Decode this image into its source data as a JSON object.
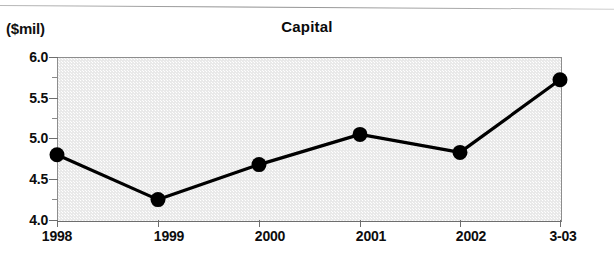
{
  "figure": {
    "unit_label": "($mil)",
    "title": "Capital"
  },
  "chart_data": {
    "type": "line",
    "title": "Capital",
    "subtitle": "",
    "xlabel": "",
    "ylabel": "($mil)",
    "unit": "$mil",
    "categories": [
      "1998",
      "1999",
      "2000",
      "2001",
      "2002",
      "3-03"
    ],
    "values": [
      4.8,
      4.25,
      4.68,
      5.05,
      4.83,
      5.72
    ],
    "series": [
      {
        "name": "Capital",
        "values": [
          4.8,
          4.25,
          4.68,
          5.05,
          4.83,
          5.72
        ]
      }
    ],
    "ylim": [
      4.0,
      6.0
    ],
    "y_major_ticks": [
      "4.0",
      "4.5",
      "5.0",
      "5.5",
      "6.0"
    ],
    "y_major_tick_values": [
      4.0,
      4.5,
      5.0,
      5.5,
      6.0
    ],
    "y_minor_tick_values": [
      4.25,
      4.75,
      5.25,
      5.75
    ],
    "y_tick_interval": 0.5,
    "y_minor_tick_interval": 0.25,
    "grid": false,
    "legend": "none",
    "marker": "filled-circle",
    "line_color": "#000000",
    "marker_color": "#000000",
    "plot_background": "#e9e9e9",
    "plot_border_color": "#8d8d8d"
  },
  "y_axis": {
    "ticks": [
      {
        "label": "6.0",
        "value": 6.0
      },
      {
        "label": "5.5",
        "value": 5.5
      },
      {
        "label": "5.0",
        "value": 5.0
      },
      {
        "label": "4.5",
        "value": 4.5
      },
      {
        "label": "4.0",
        "value": 4.0
      }
    ]
  },
  "x_axis": {
    "ticks": [
      {
        "label": "1998"
      },
      {
        "label": "1999"
      },
      {
        "label": "2000"
      },
      {
        "label": "2001"
      },
      {
        "label": "2002"
      },
      {
        "label": "3-03"
      }
    ]
  }
}
